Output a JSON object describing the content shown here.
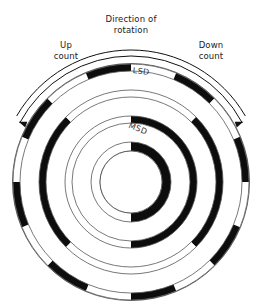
{
  "figure": {
    "title_lines": [
      "Direction of",
      "rotation"
    ],
    "left_label_lines": [
      "Up",
      "count"
    ],
    "right_label_lines": [
      "Down",
      "count"
    ],
    "track_labels": {
      "outer": "LSD",
      "inner": "MSD"
    },
    "colors": {
      "ink": "#111111",
      "paper": "#ffffff",
      "segment_dark": "#0d0d0d",
      "segment_light": "#ffffff",
      "ring_line": "#555555",
      "text": "#222222"
    },
    "geometry": {
      "center_x": 131,
      "center_y": 182,
      "outer_radius": 118,
      "hub_radius": 31,
      "ring_boundaries": [
        118,
        111,
        92,
        85,
        66,
        59,
        40,
        31
      ],
      "arrow_arc_radius": 126,
      "arrow_arc_start_deg": 208,
      "arrow_arc_end_deg": 332
    }
  },
  "chart_data": {
    "type": "encoder-disc",
    "title": "Direction of rotation",
    "track_count": 4,
    "zero_angle_deg": 90,
    "angle_direction": "clockwise from 12 o'clock",
    "tracks": [
      {
        "name": "MSD",
        "index": 0,
        "position": "innermost",
        "r_inner": 31,
        "r_outer": 40,
        "sector_count": 2,
        "sector_span_deg": 180,
        "bits": [
          1,
          0
        ],
        "note": "dark sector occupies 180 degrees from 12 o'clock counter-clockwise (left half)"
      },
      {
        "name": "Track 2",
        "index": 1,
        "r_inner": 59,
        "r_outer": 66,
        "sector_count": 4,
        "sector_span_deg": 90,
        "bits": [
          1,
          1,
          0,
          0
        ],
        "note": "dark sectors at 180-360 degrees clockwise from top"
      },
      {
        "name": "Track 3",
        "index": 2,
        "r_inner": 85,
        "r_outer": 92,
        "sector_count": 8,
        "sector_span_deg": 45,
        "bits": [
          0,
          1,
          1,
          0,
          0,
          1,
          1,
          0
        ]
      },
      {
        "name": "LSD",
        "index": 3,
        "position": "outermost",
        "r_inner": 111,
        "r_outer": 118,
        "sector_count": 16,
        "sector_span_deg": 22.5,
        "bits": [
          0,
          1,
          0,
          1,
          0,
          1,
          0,
          1,
          0,
          1,
          0,
          1,
          0,
          1,
          0,
          1
        ]
      }
    ],
    "annotations": [
      {
        "text": "Direction of rotation",
        "position": "top-center"
      },
      {
        "text": "Up count",
        "position": "top-left",
        "arrow": "counter-clockwise"
      },
      {
        "text": "Down count",
        "position": "top-right",
        "arrow": "clockwise"
      },
      {
        "text": "LSD",
        "position": "outer-track-top"
      },
      {
        "text": "MSD",
        "position": "inner-track-top"
      }
    ]
  }
}
